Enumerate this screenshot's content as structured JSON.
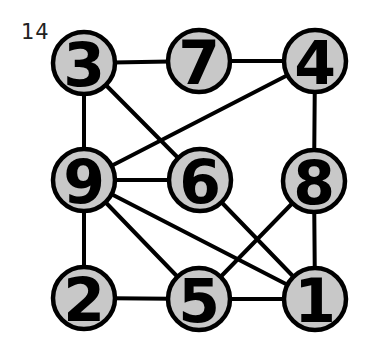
{
  "puzzle": {
    "label": "14",
    "node_fill": "#c8c8c8",
    "stroke_color": "#000000",
    "node_radius": 31
  },
  "nodes": [
    {
      "id": "n3",
      "label": "3",
      "x": 84,
      "y": 63
    },
    {
      "id": "n7",
      "label": "7",
      "x": 199,
      "y": 61
    },
    {
      "id": "n4",
      "label": "4",
      "x": 315,
      "y": 61
    },
    {
      "id": "n9",
      "label": "9",
      "x": 84,
      "y": 180
    },
    {
      "id": "n6",
      "label": "6",
      "x": 200,
      "y": 180
    },
    {
      "id": "n8",
      "label": "8",
      "x": 314,
      "y": 181
    },
    {
      "id": "n2",
      "label": "2",
      "x": 84,
      "y": 298
    },
    {
      "id": "n5",
      "label": "5",
      "x": 199,
      "y": 299
    },
    {
      "id": "n1",
      "label": "1",
      "x": 315,
      "y": 299
    }
  ],
  "edges": [
    {
      "from": "3",
      "to": "7"
    },
    {
      "from": "7",
      "to": "4"
    },
    {
      "from": "3",
      "to": "9"
    },
    {
      "from": "3",
      "to": "6"
    },
    {
      "from": "4",
      "to": "9"
    },
    {
      "from": "4",
      "to": "8"
    },
    {
      "from": "9",
      "to": "6"
    },
    {
      "from": "9",
      "to": "2"
    },
    {
      "from": "9",
      "to": "5"
    },
    {
      "from": "9",
      "to": "1"
    },
    {
      "from": "6",
      "to": "1"
    },
    {
      "from": "8",
      "to": "5"
    },
    {
      "from": "8",
      "to": "1"
    },
    {
      "from": "2",
      "to": "5"
    },
    {
      "from": "5",
      "to": "1"
    }
  ]
}
